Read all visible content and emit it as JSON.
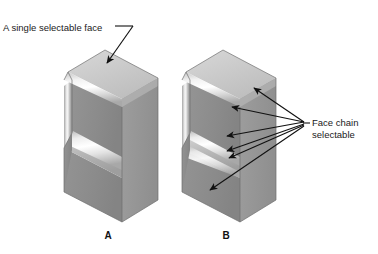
{
  "figure": {
    "title_text_visible": false,
    "background_color": "#ffffff",
    "callouts": [
      {
        "id": "single-face",
        "text": "A single selectable face",
        "text_x": 3,
        "text_y": 31,
        "leader_from_x": 115,
        "leader_from_y": 26,
        "leader_mid_x": 131,
        "leader_mid_y": 26,
        "arrow_tip_x": 106,
        "arrow_tip_y": 68
      },
      {
        "id": "face-chain",
        "line1": "Face chain",
        "line2": "selectable",
        "text_x": 312,
        "text_y": 126,
        "line2_y": 138,
        "hub_x": 306,
        "hub_y": 123,
        "stub_from_x": 306,
        "stub_from_y": 123,
        "stub_to_x": 310,
        "stub_to_y": 123
      }
    ],
    "chain_arrow_tips": [
      {
        "x": 249,
        "y": 85
      },
      {
        "x": 228,
        "y": 104
      },
      {
        "x": 222,
        "y": 136
      },
      {
        "x": 222,
        "y": 152
      },
      {
        "x": 225,
        "y": 159
      },
      {
        "x": 205,
        "y": 193
      }
    ],
    "parts": [
      {
        "id": "part-a",
        "label": "A",
        "label_x": 108,
        "label_y": 239,
        "origin_x": 0,
        "origin_y": 0
      },
      {
        "id": "part-b",
        "label": "B",
        "label_x": 226,
        "label_y": 239,
        "origin_x": 118,
        "origin_y": 0
      }
    ],
    "shading": {
      "top_face": "#c9c9c9",
      "top_face_light": "#d6d6d6",
      "left_face": "#8c8c8c",
      "left_face_dark": "#7e7e7e",
      "right_face": "#9a9a9a",
      "right_face_dark": "#8a8a8a",
      "fillet_highlight": "#fbfbfb",
      "fillet_mid": "#d9d9d9",
      "shadow_edge": "#6f6f6f",
      "outline": "#6a6a6a"
    }
  }
}
